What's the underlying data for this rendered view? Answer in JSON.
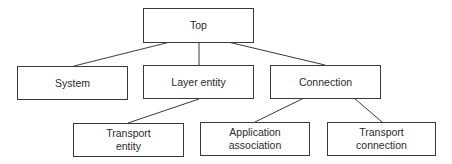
{
  "diagram": {
    "type": "tree",
    "nodes": [
      {
        "id": "top",
        "label": "Top",
        "x": 143,
        "y": 8,
        "w": 111,
        "h": 35
      },
      {
        "id": "system",
        "label": "System",
        "x": 17,
        "y": 66,
        "w": 111,
        "h": 34
      },
      {
        "id": "layer_entity",
        "label": "Layer entity",
        "x": 143,
        "y": 65,
        "w": 111,
        "h": 34
      },
      {
        "id": "connection",
        "label": "Connection",
        "x": 270,
        "y": 65,
        "w": 111,
        "h": 34
      },
      {
        "id": "transport_entity",
        "label": "Transport\nentity",
        "x": 73,
        "y": 123,
        "w": 111,
        "h": 34
      },
      {
        "id": "application_association",
        "label": "Application\nassociation",
        "x": 200,
        "y": 122,
        "w": 110,
        "h": 34
      },
      {
        "id": "transport_connection",
        "label": "Transport\nconnection",
        "x": 327,
        "y": 122,
        "w": 109,
        "h": 34
      }
    ],
    "edges": [
      {
        "from": "top",
        "to": "system",
        "x1": 170,
        "y1": 42,
        "x2": 74,
        "y2": 66
      },
      {
        "from": "top",
        "to": "layer_entity",
        "x1": 199,
        "y1": 42,
        "x2": 199,
        "y2": 65
      },
      {
        "from": "top",
        "to": "connection",
        "x1": 228,
        "y1": 42,
        "x2": 325,
        "y2": 65
      },
      {
        "from": "layer_entity",
        "to": "transport_entity",
        "x1": 199,
        "y1": 99,
        "x2": 128,
        "y2": 123
      },
      {
        "from": "connection",
        "to": "application_association",
        "x1": 304,
        "y1": 98,
        "x2": 255,
        "y2": 122
      },
      {
        "from": "connection",
        "to": "transport_connection",
        "x1": 354,
        "y1": 98,
        "x2": 382,
        "y2": 122
      }
    ],
    "colors": {
      "line": "#3a3a3a",
      "text": "#2a2a2a",
      "background": "#ffffff"
    }
  }
}
